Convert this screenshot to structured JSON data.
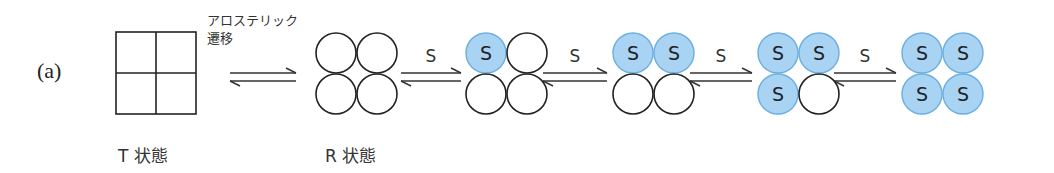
{
  "panel_label": "(a)",
  "transition_caption": {
    "line1": "アロステリック",
    "line2": "遷移"
  },
  "t_state_label": "T 状態",
  "r_state_label": "R 状態",
  "ligand_symbol": "S",
  "colors": {
    "bound": "#a9d3f2",
    "bound_stroke": "#6aaee0",
    "line": "#222222"
  },
  "steps": [
    {
      "arrow_label": "",
      "bound": 0,
      "shape": "square"
    },
    {
      "arrow_label": "",
      "bound": 0,
      "shape": "circles"
    },
    {
      "arrow_label": "S",
      "bound": 1,
      "shape": "circles"
    },
    {
      "arrow_label": "S",
      "bound": 2,
      "shape": "circles"
    },
    {
      "arrow_label": "S",
      "bound": 3,
      "shape": "circles"
    },
    {
      "arrow_label": "S",
      "bound": 4,
      "shape": "circles"
    }
  ]
}
